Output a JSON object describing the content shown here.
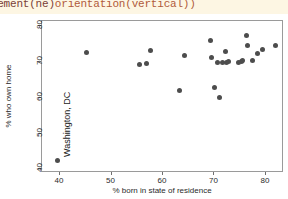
{
  "code_banner": {
    "visible_text": "lacement(ne) orientation(vertical))",
    "part_fn": "lacement(ne)",
    "part_arg": "orientation(vertical))",
    "background_color": "#fdf6e3",
    "text_color": "#8a4a3c"
  },
  "chart_data": {
    "type": "scatter",
    "title": "",
    "subtitle": "",
    "xlabel": "% born in state of residence",
    "ylabel": "% who own home",
    "xlim": [
      36.5,
      83.5
    ],
    "ylim": [
      39.0,
      81.5
    ],
    "xticks": [
      40,
      50,
      60,
      70,
      80
    ],
    "yticks": [
      40,
      50,
      60,
      70,
      80
    ],
    "xtick_labels": [
      "40",
      "50",
      "60",
      "70",
      "80"
    ],
    "ytick_labels": [
      "40",
      "50",
      "60",
      "70",
      "80"
    ],
    "grid": false,
    "legend": null,
    "legend_position": "none",
    "marker_color": "#4d4d4d",
    "marker_size_px": 5,
    "panel_border_color": "#9a9a9a",
    "annotations": [
      {
        "text": "Washington, DC",
        "x": 39.5,
        "y": 42.5,
        "orientation": "vertical",
        "placement": "ne"
      }
    ],
    "points": [
      {
        "x": 39.5,
        "y": 42.5
      },
      {
        "x": 45.1,
        "y": 72.7
      },
      {
        "x": 55.4,
        "y": 69.2
      },
      {
        "x": 56.7,
        "y": 69.7
      },
      {
        "x": 57.6,
        "y": 73.3
      },
      {
        "x": 63.3,
        "y": 62.2
      },
      {
        "x": 64.1,
        "y": 71.8
      },
      {
        "x": 69.3,
        "y": 76.0
      },
      {
        "x": 69.5,
        "y": 71.4
      },
      {
        "x": 70.0,
        "y": 62.9
      },
      {
        "x": 70.5,
        "y": 69.8
      },
      {
        "x": 71.0,
        "y": 60.2
      },
      {
        "x": 71.6,
        "y": 70.0
      },
      {
        "x": 72.1,
        "y": 72.9
      },
      {
        "x": 72.3,
        "y": 70.0
      },
      {
        "x": 72.8,
        "y": 70.1
      },
      {
        "x": 74.6,
        "y": 70.0
      },
      {
        "x": 75.2,
        "y": 70.2
      },
      {
        "x": 75.4,
        "y": 70.4
      },
      {
        "x": 76.3,
        "y": 77.4
      },
      {
        "x": 76.4,
        "y": 74.7
      },
      {
        "x": 77.3,
        "y": 70.5
      },
      {
        "x": 78.3,
        "y": 72.4
      },
      {
        "x": 79.4,
        "y": 73.4
      },
      {
        "x": 81.8,
        "y": 74.6
      }
    ]
  }
}
